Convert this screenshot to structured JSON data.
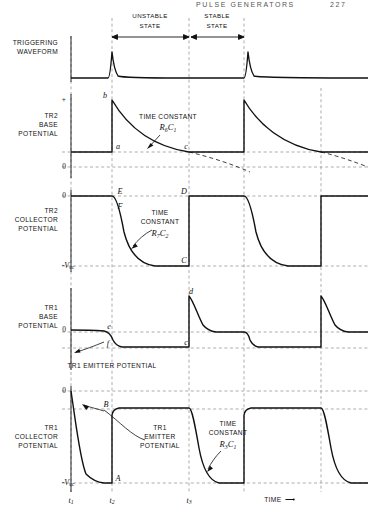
{
  "page": {
    "header_right": "PULSE GENERATORS",
    "page_number": "227"
  },
  "axis": {
    "time_label": "TIME",
    "time_arrow": "⟶",
    "ticks": [
      {
        "id": "t1",
        "label": "t",
        "sub": "1"
      },
      {
        "id": "t2",
        "label": "t",
        "sub": "2"
      },
      {
        "id": "t3",
        "label": "t",
        "sub": "3"
      }
    ]
  },
  "state_spans": [
    {
      "label_line1": "UNSTABLE",
      "label_line2": "STATE"
    },
    {
      "label_line1": "STABLE",
      "label_line2": "STATE"
    }
  ],
  "traces": [
    {
      "id": "triggering-waveform",
      "label_lines": [
        "TRIGGERING",
        "WAVEFORM"
      ],
      "axis_marks": []
    },
    {
      "id": "tr2-base-potential",
      "label_lines": [
        "TR2",
        "BASE",
        "POTENTIAL"
      ],
      "axis_marks": [
        {
          "text": "+",
          "kind": "plain"
        },
        {
          "text": "0",
          "kind": "plain"
        }
      ],
      "points": [
        "a",
        "b",
        "c"
      ],
      "annotation": {
        "line1": "TIME CONSTANT",
        "r": "R",
        "r_sub": "6",
        "c": "C",
        "c_sub": "1"
      }
    },
    {
      "id": "tr2-collector-potential",
      "label_lines": [
        "TR2",
        "COLLECTOR",
        "POTENTIAL"
      ],
      "axis_marks": [
        {
          "text": "0",
          "kind": "plain"
        },
        {
          "text": "-V",
          "sub": "cc",
          "kind": "italic"
        }
      ],
      "points": [
        "E",
        "F",
        "D",
        "C"
      ],
      "annotation": {
        "line1": "TIME",
        "line2": "CONSTANT",
        "r": "R",
        "r_sub": "7",
        "c": "C",
        "c_sub": "2"
      }
    },
    {
      "id": "tr1-base-potential",
      "label_lines": [
        "TR1",
        "BASE",
        "POTENTIAL"
      ],
      "axis_marks": [
        {
          "text": "0",
          "kind": "plain"
        }
      ],
      "points": [
        "d",
        "e",
        "f",
        "c"
      ],
      "callout": "TR1 EMITTER POTENTIAL"
    },
    {
      "id": "tr1-collector-potential",
      "label_lines": [
        "TR1",
        "COLLECTOR",
        "POTENTIAL"
      ],
      "axis_marks": [
        {
          "text": "0",
          "kind": "plain"
        },
        {
          "text": "-V",
          "sub": "cc",
          "kind": "italic"
        }
      ],
      "points": [
        "A",
        "B"
      ],
      "callout_lines": [
        "TR1",
        "EMITTER",
        "POTENTIAL"
      ],
      "annotation": {
        "line1": "TIME",
        "line2": "CONSTANT",
        "r": "R",
        "r_sub": "3",
        "c": "C",
        "c_sub": "1"
      }
    }
  ],
  "colors": {
    "ink": "#111111",
    "grid": "#888888",
    "paper": "#ffffff"
  }
}
